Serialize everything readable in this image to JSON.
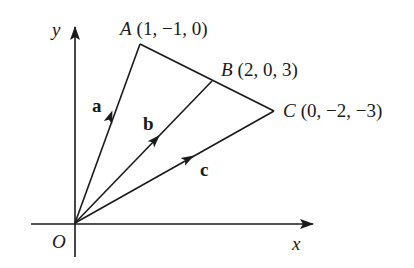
{
  "diagram": {
    "title": "",
    "type": "vector-diagram",
    "colors": {
      "background": "#ffffff",
      "ink": "#1a1a1a"
    },
    "axes": {
      "x_label": "x",
      "y_label": "y",
      "origin_label": "O"
    },
    "points": [
      {
        "name": "A",
        "coords": "(1, −1, 0)"
      },
      {
        "name": "B",
        "coords": "(2, 0, 3)"
      },
      {
        "name": "C",
        "coords": "(0, −2, −3)"
      }
    ],
    "vectors": [
      {
        "label": "a",
        "from": "O",
        "to": "A"
      },
      {
        "label": "b",
        "from": "O",
        "to": "B"
      },
      {
        "label": "c",
        "from": "O",
        "to": "C"
      }
    ],
    "segments": [
      {
        "from": "A",
        "to": "B"
      },
      {
        "from": "B",
        "to": "C"
      }
    ]
  }
}
